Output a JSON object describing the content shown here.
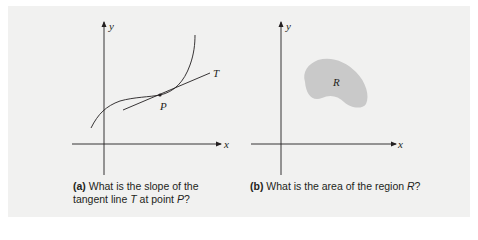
{
  "figure_a": {
    "tag": "(a)",
    "caption_line1": " What is the slope of the",
    "caption_line2_prefix": "tangent line ",
    "caption_T": "T",
    "caption_mid": " at point ",
    "caption_P": "P",
    "caption_end": "?",
    "labels": {
      "x_axis": "x",
      "y_axis": "y",
      "tangent": "T",
      "point": "P"
    }
  },
  "figure_b": {
    "tag": "(b)",
    "caption_text": " What is the area of the region ",
    "caption_R": "R",
    "caption_end": "?",
    "labels": {
      "x_axis": "x",
      "y_axis": "y",
      "region": "R"
    }
  },
  "colors": {
    "panel_bg": "#f1f1f0",
    "ink": "#231f20",
    "region_fill": "#c9c9c9"
  }
}
